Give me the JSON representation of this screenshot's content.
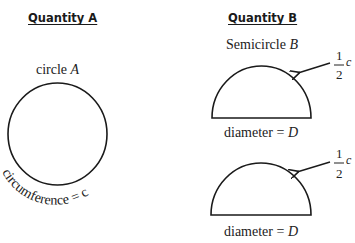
{
  "quantity_a": {
    "heading": "Quantity A",
    "label_prefix": "circle ",
    "label_var": "A",
    "circumference_label": "circumference = c"
  },
  "quantity_b": {
    "heading": "Quantity B",
    "label_prefix": "Semicircle ",
    "label_var": "B",
    "figures": [
      {
        "arc_numerator": "1",
        "arc_denominator": "2",
        "arc_var": "c",
        "diameter_prefix": "diameter = ",
        "diameter_var": "D"
      },
      {
        "arc_numerator": "1",
        "arc_denominator": "2",
        "arc_var": "c",
        "diameter_prefix": "diameter = ",
        "diameter_var": "D"
      }
    ]
  },
  "colors": {
    "stroke": "#1a1a1a",
    "text": "#222222",
    "background": "#ffffff"
  }
}
